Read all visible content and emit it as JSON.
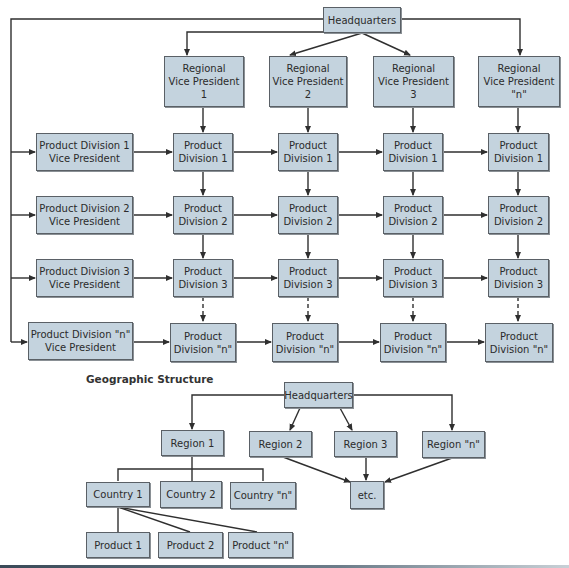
{
  "matrix": {
    "headquarters": "Headquarters",
    "regional_vps": [
      "Regional\nVice President\n1",
      "Regional\nVice President\n2",
      "Regional\nVice President\n3",
      "Regional\nVice President\n\"n\""
    ],
    "division_vps": [
      "Product Division 1\nVice President",
      "Product Division 2\nVice President",
      "Product Division 3\nVice President",
      "Product Division \"n\"\nVice President"
    ],
    "grid_rows": [
      [
        "Product\nDivision 1",
        "Product\nDivision 1",
        "Product\nDivision 1",
        "Product\nDivision 1"
      ],
      [
        "Product\nDivision 2",
        "Product\nDivision 2",
        "Product\nDivision 2",
        "Product\nDivision 2"
      ],
      [
        "Product\nDivision 3",
        "Product\nDivision 3",
        "Product\nDivision 3",
        "Product\nDivision 3"
      ],
      [
        "Product\nDivision \"n\"",
        "Product\nDivision \"n\"",
        "Product\nDivision \"n\"",
        "Product\nDivision \"n\""
      ]
    ]
  },
  "geographic": {
    "title": "Geographic Structure",
    "headquarters": "Headquarters",
    "regions": [
      "Region 1",
      "Region 2",
      "Region 3",
      "Region \"n\""
    ],
    "countries": [
      "Country 1",
      "Country 2",
      "Country \"n\""
    ],
    "products": [
      "Product 1",
      "Product 2",
      "Product \"n\""
    ],
    "etc": "etc."
  },
  "colors": {
    "box_fill": "#c4d3de",
    "box_border": "#5a6066",
    "line": "#2f2f2f"
  }
}
